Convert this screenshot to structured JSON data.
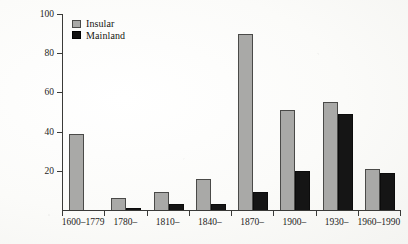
{
  "chart_data": {
    "type": "bar",
    "title": "",
    "subtitle": "",
    "xlabel": "",
    "ylabel": "No. of extinctions",
    "categories": [
      "1600–1779",
      "1780–",
      "1810–",
      "1840–",
      "1870–",
      "1900–",
      "1930–",
      "1960–1990"
    ],
    "series": [
      {
        "name": "Insular",
        "color": "#a9a9a7",
        "values": [
          39,
          6,
          9,
          16,
          90,
          51,
          55,
          21
        ]
      },
      {
        "name": "Mainland",
        "color": "#151515",
        "values": [
          0,
          1,
          3,
          3,
          9,
          20,
          49,
          19
        ]
      }
    ],
    "ylim": [
      0,
      100
    ],
    "yticks": [
      20,
      40,
      60,
      80,
      100
    ],
    "ytick_labels": [
      "20",
      "40",
      "60",
      "80",
      "100"
    ],
    "grid": false,
    "legend_position": "top-left"
  },
  "legend": {
    "entries": [
      {
        "label": "Insular",
        "swatch": "gray-square-swatch"
      },
      {
        "label": "Mainland",
        "swatch": "black-square-swatch"
      }
    ]
  },
  "axes": {
    "y_title": "No. of extinctions",
    "y_tick_labels": [
      "100",
      "80",
      "60",
      "40",
      "20"
    ],
    "x_tick_labels": [
      "1600–1779",
      "1780–",
      "1810–",
      "1840–",
      "1870–",
      "1900–",
      "1930–",
      "1960–1990"
    ]
  },
  "colors": {
    "insular": "#a9a9a7",
    "mainland": "#151515",
    "axis": "#3a3a38",
    "background": "#fdfdfb"
  }
}
